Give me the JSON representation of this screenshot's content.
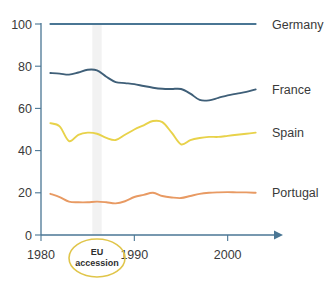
{
  "chart_data": {
    "type": "line",
    "title": "",
    "subtitle": "",
    "xlabel": "",
    "ylabel": "",
    "xlim": [
      1980,
      2004
    ],
    "ylim": [
      0,
      100
    ],
    "grid": false,
    "legend_position": "right-inline",
    "x_ticks": [
      "1980",
      "1990",
      "2000"
    ],
    "x_tick_values": [
      1980,
      1990,
      2000
    ],
    "y_ticks": [
      "0",
      "20",
      "40",
      "60",
      "80",
      "100"
    ],
    "y_tick_values": [
      0,
      20,
      40,
      60,
      80,
      100
    ],
    "x": [
      1981,
      1982,
      1983,
      1984,
      1985,
      1986,
      1987,
      1988,
      1989,
      1990,
      1991,
      1992,
      1993,
      1994,
      1995,
      1996,
      1997,
      1998,
      1999,
      2000,
      2001,
      2002,
      2003
    ],
    "series": [
      {
        "name": "Germany",
        "color": "#4a7694",
        "values": [
          100,
          100,
          100,
          100,
          100,
          100,
          100,
          100,
          100,
          100,
          100,
          100,
          100,
          100,
          100,
          100,
          100,
          100,
          100,
          100,
          100,
          100,
          100
        ]
      },
      {
        "name": "France",
        "color": "#3f5f78",
        "values": [
          76.8,
          76.5,
          76.0,
          77.0,
          78.3,
          78.0,
          75.0,
          72.5,
          72.0,
          71.5,
          70.6,
          69.8,
          69.3,
          69.2,
          69.2,
          67.0,
          64.0,
          63.8,
          65.0,
          66.2,
          67.0,
          67.8,
          69.0
        ]
      },
      {
        "name": "Spain",
        "color": "#e8d24a",
        "values": [
          53.0,
          51.5,
          44.5,
          47.5,
          48.5,
          48.0,
          46.0,
          45.0,
          47.5,
          50.0,
          52.0,
          54.0,
          53.5,
          48.5,
          43.0,
          45.0,
          46.0,
          46.5,
          46.5,
          47.0,
          47.5,
          48.0,
          48.5
        ]
      },
      {
        "name": "Portugal",
        "color": "#e89a63",
        "values": [
          19.5,
          18.0,
          15.8,
          15.5,
          15.5,
          15.8,
          15.5,
          15.0,
          16.0,
          18.0,
          19.0,
          20.0,
          18.5,
          17.8,
          17.5,
          18.5,
          19.5,
          20.0,
          20.2,
          20.3,
          20.2,
          20.2,
          20.0
        ]
      }
    ],
    "annotations": [
      {
        "name": "eu-accession",
        "line1": "EU",
        "line2": "accession",
        "x_value": 1986,
        "shape": "ellipse",
        "color": "#e0c54a"
      }
    ],
    "highlight_band": {
      "from": 1985.5,
      "to": 1986.5,
      "color": "#f2f2f2"
    }
  },
  "axis": {
    "color": "#4a7694",
    "arrow": true
  },
  "caption": {
    "text": ""
  }
}
